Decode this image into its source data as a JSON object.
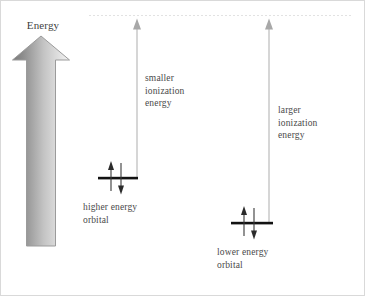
{
  "figure": {
    "title_label": "Energy",
    "axis_label": "Energy",
    "dashed_reference_line": {
      "name": "ionization-limit-line",
      "y": 14,
      "x_start": 88,
      "x_end": 352,
      "color": "#e3e3e3",
      "style": "dashed"
    },
    "energy_arrow": {
      "name": "energy-axis-arrow",
      "direction": "up",
      "gradient_from": "#7d7d7d",
      "gradient_to": "#f2f2f2",
      "outline": "#9a9a9a"
    },
    "measures": [
      {
        "id": "smaller",
        "label": "smaller\nionization\nenergy",
        "arrow_color": "#b8b8b8",
        "arrow_x": 136,
        "arrow_top": 18,
        "arrow_bottom": 177
      },
      {
        "id": "larger",
        "label": "larger\nionization\nenergy",
        "arrow_color": "#b8b8b8",
        "arrow_x": 268,
        "arrow_top": 18,
        "arrow_bottom": 222
      }
    ],
    "orbitals": [
      {
        "id": "higher",
        "label": "higher energy\norbital",
        "level_color": "#111111",
        "level_y": 177,
        "level_x_start": 97,
        "level_x_end": 137,
        "electron_up": "↑",
        "electron_down": "↓"
      },
      {
        "id": "lower",
        "label": "lower energy\norbital",
        "level_color": "#111111",
        "level_y": 222,
        "level_x_start": 230,
        "level_x_end": 272,
        "electron_up": "↑",
        "electron_down": "↓"
      }
    ]
  }
}
